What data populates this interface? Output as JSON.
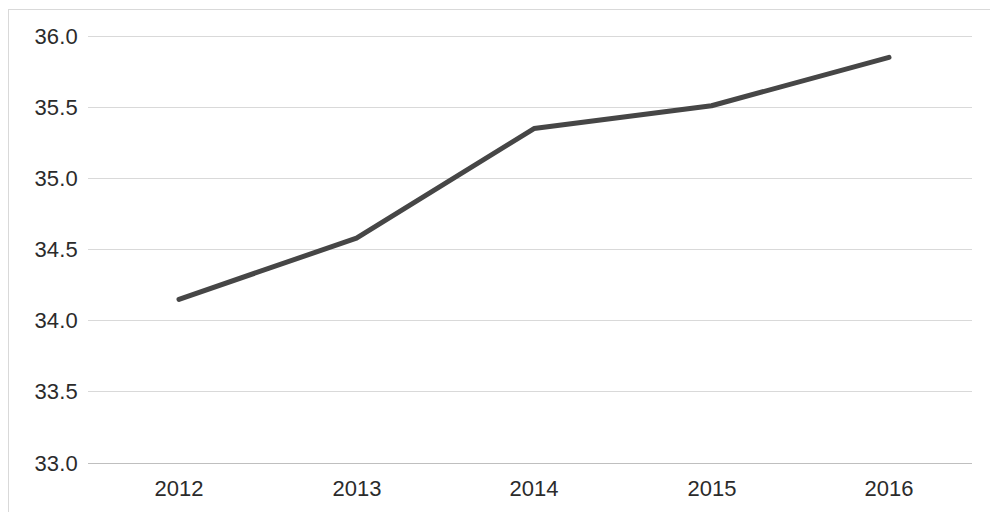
{
  "chart_data": {
    "type": "line",
    "title": "",
    "subtitle": "",
    "xlabel": "",
    "ylabel": "",
    "categories": [
      "2012",
      "2013",
      "2014",
      "2015",
      "2016"
    ],
    "series": [
      {
        "name": "",
        "values": [
          34.15,
          34.58,
          35.35,
          35.51,
          35.85
        ]
      }
    ],
    "ylim": [
      33.0,
      36.0
    ],
    "ytick_labels": [
      "36.0",
      "35.5",
      "35.0",
      "34.5",
      "34.0",
      "33.5",
      "33.0"
    ],
    "ytick_values": [
      36.0,
      35.5,
      35.0,
      34.5,
      34.0,
      33.5,
      33.0
    ],
    "xtick_labels": [
      "2012",
      "2013",
      "2014",
      "2015",
      "2016"
    ],
    "grid": true,
    "grid_axis": "y",
    "legend": false,
    "legend_position": "none",
    "markers": false,
    "colors": {
      "line": "#464646",
      "gridline": "#d9d9d9",
      "axis": "#bfbfbf",
      "tick_text": "#2b2b2b",
      "background": "#ffffff",
      "frame": "#d9d9d9"
    },
    "line_width": 5
  }
}
